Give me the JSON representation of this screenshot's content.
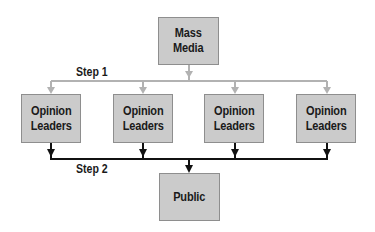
{
  "diagram": {
    "source": {
      "label": "Mass Media",
      "lines": [
        "Mass",
        "Media"
      ]
    },
    "intermediaries": [
      {
        "label": "Opinion Leaders",
        "lines": [
          "Opinion",
          "Leaders"
        ]
      },
      {
        "label": "Opinion Leaders",
        "lines": [
          "Opinion",
          "Leaders"
        ]
      },
      {
        "label": "Opinion Leaders",
        "lines": [
          "Opinion",
          "Leaders"
        ]
      },
      {
        "label": "Opinion Leaders",
        "lines": [
          "Opinion",
          "Leaders"
        ]
      }
    ],
    "target": {
      "label": "Public"
    },
    "steps": [
      {
        "label": "Step 1",
        "from": "Mass Media",
        "to": "Opinion Leaders",
        "color": "#b2b2b2"
      },
      {
        "label": "Step 2",
        "from": "Opinion Leaders",
        "to": "Public",
        "color": "#111111"
      }
    ],
    "colors": {
      "box_fill": "#cbcbcb",
      "box_border": "#8e8e8e",
      "step1_line": "#b2b2b2",
      "step2_line": "#111111"
    }
  }
}
